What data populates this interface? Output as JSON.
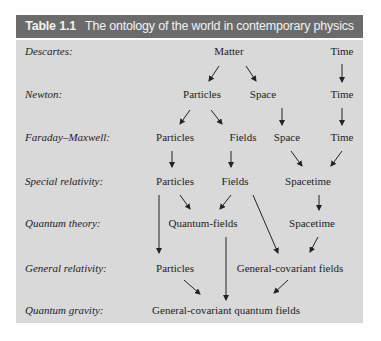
{
  "table": {
    "number": "Table 1.1",
    "title": "The ontology of the world in contemporary physics",
    "colors": {
      "header_bg": "#6b6b6b",
      "header_text": "#f2f2f2",
      "body_bg": "#d9d9d9",
      "text": "#222222"
    },
    "rows": [
      {
        "label": "Descartes:",
        "nodes": [
          "Matter",
          "Time"
        ]
      },
      {
        "label": "Newton:",
        "nodes": [
          "Particles",
          "Space",
          "Time"
        ]
      },
      {
        "label": "Faraday–Maxwell:",
        "nodes": [
          "Particles",
          "Fields",
          "Space",
          "Time"
        ]
      },
      {
        "label": "Special relativity:",
        "nodes": [
          "Particles",
          "Fields",
          "Spacetime"
        ]
      },
      {
        "label": "Quantum theory:",
        "nodes": [
          "Quantum-fields",
          "Spacetime"
        ]
      },
      {
        "label": "General relativity:",
        "nodes": [
          "Particles",
          "General-covariant fields"
        ]
      },
      {
        "label": "Quantum gravity:",
        "nodes": [
          "General-covariant quantum fields"
        ]
      }
    ]
  }
}
